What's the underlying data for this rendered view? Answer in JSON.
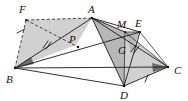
{
  "figure": {
    "background_color": "#ffffff",
    "line_color": "#1a1a1a",
    "shade_light": "#c9c9c9",
    "shade_mid": "#b4b4b4",
    "shade_dark": "#6e6e6e",
    "points": [
      {
        "id": "F",
        "label": "F",
        "x": 26,
        "y": 20,
        "label_x": 20,
        "label_y": 12
      },
      {
        "id": "A",
        "label": "A",
        "x": 92,
        "y": 18,
        "label_x": 90,
        "label_y": 12
      },
      {
        "id": "B",
        "label": "B",
        "x": 15,
        "y": 68,
        "label_x": 8,
        "label_y": 80
      },
      {
        "id": "C",
        "label": "C",
        "x": 168,
        "y": 67,
        "label_x": 175,
        "label_y": 72
      },
      {
        "id": "D",
        "label": "D",
        "x": 124,
        "y": 86,
        "label_x": 121,
        "label_y": 98
      },
      {
        "id": "E",
        "label": "E",
        "x": 140,
        "y": 32,
        "label_x": 137,
        "label_y": 25
      },
      {
        "id": "M",
        "label": "M",
        "x": 125,
        "y": 32,
        "label_x": 119,
        "label_y": 26
      },
      {
        "id": "G",
        "label": "G",
        "x": 127,
        "y": 48,
        "label_x": 120,
        "label_y": 52
      },
      {
        "id": "P",
        "label": "P",
        "x": 76,
        "y": 45,
        "label_x": 70,
        "label_y": 41
      }
    ],
    "segments": [
      {
        "name": "segment-F-A",
        "from": "F",
        "to": "A",
        "style": "dashed"
      },
      {
        "name": "segment-F-B",
        "from": "F",
        "to": "B",
        "style": "dashed"
      },
      {
        "name": "segment-F-P",
        "from": "F",
        "to": "P",
        "style": "dashed"
      },
      {
        "name": "segment-B-A",
        "from": "B",
        "to": "A",
        "style": "solid"
      },
      {
        "name": "segment-B-C",
        "from": "B",
        "to": "C",
        "style": "solid"
      },
      {
        "name": "segment-B-D",
        "from": "B",
        "to": "D",
        "style": "solid"
      },
      {
        "name": "segment-B-E",
        "from": "B",
        "to": "E",
        "style": "solid"
      },
      {
        "name": "segment-A-D",
        "from": "A",
        "to": "D",
        "style": "solid"
      },
      {
        "name": "segment-A-C",
        "from": "A",
        "to": "C",
        "style": "solid"
      },
      {
        "name": "segment-A-E",
        "from": "A",
        "to": "E",
        "style": "solid"
      },
      {
        "name": "segment-D-C",
        "from": "D",
        "to": "C",
        "style": "solid"
      },
      {
        "name": "segment-D-E",
        "from": "D",
        "to": "E",
        "style": "solid"
      },
      {
        "name": "segment-M-C",
        "from": "M",
        "to": "C",
        "style": "solid"
      },
      {
        "name": "segment-E-C",
        "from": "E",
        "to": "C",
        "style": "solid"
      }
    ],
    "shaded_regions": [
      {
        "name": "region-FABP",
        "shade": "light",
        "vertices": [
          "F",
          "A",
          "P",
          "B"
        ]
      },
      {
        "name": "region-AMDC",
        "shade": "light",
        "vertices": [
          "A",
          "M",
          "C",
          "D"
        ]
      },
      {
        "name": "region-MEG",
        "shade": "mid",
        "vertices": [
          "M",
          "E",
          "G"
        ]
      }
    ],
    "angle_markers": [
      {
        "name": "angle-marker-B",
        "at": "B",
        "shade": "dark"
      },
      {
        "name": "angle-marker-C",
        "at": "C",
        "shade": "dark"
      }
    ],
    "tick_marks": [
      {
        "name": "tick-FB-single",
        "on": "segment-F-B",
        "count": 1,
        "x": 21,
        "y": 31
      },
      {
        "name": "tick-BA-double",
        "on": "segment-B-A",
        "count": 2,
        "x": 46,
        "y": 44
      },
      {
        "name": "tick-EG-double",
        "on": "segment-E-G",
        "count": 2,
        "x": 134,
        "y": 48
      },
      {
        "name": "tick-DC-single",
        "on": "segment-D-C",
        "count": 1,
        "x": 146,
        "y": 79
      }
    ]
  }
}
